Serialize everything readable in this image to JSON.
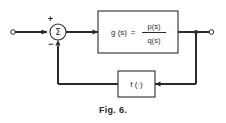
{
  "figure": {
    "caption": "Fig. 6.",
    "background_color": "#ffffff",
    "line_color": "#2a2a2a"
  },
  "summing_junction": {
    "symbol": "Σ",
    "plus_sign": "+",
    "minus_sign": "−",
    "name": "summing-junction"
  },
  "forward_block": {
    "label_left": "g (s)",
    "equals": "=",
    "numerator": "p(s)",
    "denominator": "q(s)"
  },
  "feedback_block": {
    "label": "f (·)"
  },
  "terminals": {
    "input_label": "",
    "output_label": ""
  }
}
